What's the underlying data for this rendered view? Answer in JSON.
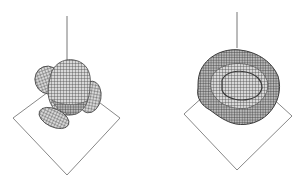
{
  "figure": {
    "panels": [
      {
        "id": "left",
        "description": "3D wireframe isosurface: cluster of lobes above a diamond-shaped base plane with a separate ellipsoidal lobe below",
        "axis_line": {
          "x": 67,
          "y1": 16,
          "y2": 62
        },
        "base_square": {
          "top": [
            67,
            78
          ],
          "right": [
            120,
            118
          ],
          "bottom": [
            67,
            175
          ],
          "left": [
            13,
            118
          ]
        }
      },
      {
        "id": "right",
        "description": "3D wireframe isosurface: single rounded toroidal blob with a central indentation above a diamond-shaped base plane",
        "axis_line": {
          "x": 237,
          "y1": 12,
          "y2": 48
        },
        "base_square": {
          "top": [
            237,
            66
          ],
          "right": [
            292,
            116
          ],
          "bottom": [
            237,
            170
          ],
          "left": [
            184,
            114
          ]
        }
      }
    ],
    "colors": {
      "line": "#777777",
      "mesh_fill": "#cfcfcf",
      "mesh_stroke": "#4a4a4a",
      "background": "#ffffff"
    }
  }
}
